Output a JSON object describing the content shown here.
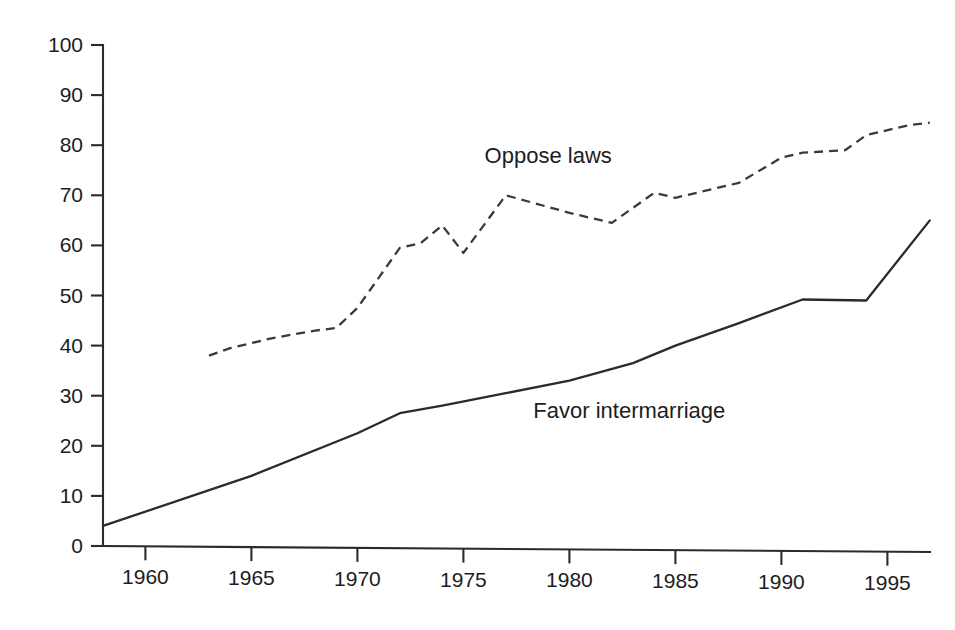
{
  "chart_data": {
    "type": "line",
    "title": "",
    "subtitle": "",
    "xlabel": "",
    "ylabel": "",
    "xlim": [
      1958,
      1997
    ],
    "ylim": [
      0,
      100
    ],
    "grid": false,
    "legend_position": "inline-annotations",
    "y_ticks": [
      0,
      10,
      20,
      30,
      40,
      50,
      60,
      70,
      80,
      90,
      100
    ],
    "y_tick_labels": [
      "0",
      "10",
      "20",
      "30",
      "40",
      "50",
      "60",
      "70",
      "80",
      "90",
      "100"
    ],
    "x_ticks": [
      1960,
      1965,
      1970,
      1975,
      1980,
      1985,
      1990,
      1995
    ],
    "x_tick_labels": [
      "1960",
      "1965",
      "1970",
      "1975",
      "1980",
      "1985",
      "1990",
      "1995"
    ],
    "series": [
      {
        "name": "Oppose laws",
        "label": "Oppose laws",
        "style": "dashed",
        "color": "#3a3a3a",
        "label_x": 1976.0,
        "label_y": 76.5,
        "x": [
          1963,
          1964,
          1965,
          1966,
          1968,
          1969,
          1970,
          1972,
          1973,
          1974,
          1975,
          1977,
          1980,
          1982,
          1984,
          1985,
          1988,
          1990,
          1991,
          1993,
          1994,
          1996,
          1997
        ],
        "values": [
          38,
          39.5,
          40.5,
          41.5,
          43,
          43.5,
          47.5,
          59.5,
          60.5,
          64,
          58.5,
          70,
          66.5,
          64.5,
          70.5,
          69.5,
          72.5,
          77.5,
          78.5,
          79,
          82,
          84,
          84.5
        ]
      },
      {
        "name": "Favor intermarriage",
        "label": "Favor intermarriage",
        "style": "solid",
        "color": "#2b2b2b",
        "label_x": 1978.3,
        "label_y": 25.5,
        "x": [
          1958,
          1965,
          1970,
          1972,
          1974,
          1977,
          1980,
          1983,
          1985,
          1988,
          1991,
          1994,
          1997
        ],
        "values": [
          4,
          14,
          22.5,
          26.5,
          28,
          30.5,
          33,
          36.5,
          40,
          44.5,
          49.2,
          49,
          65
        ]
      }
    ]
  },
  "axes": {
    "y_axis_name": "percent-axis",
    "x_axis_name": "year-axis"
  }
}
